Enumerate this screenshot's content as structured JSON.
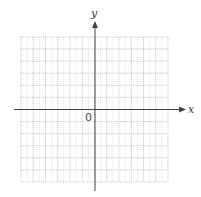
{
  "chart_data": {
    "type": "scatter",
    "title": "",
    "xlabel": "x",
    "ylabel": "y",
    "origin_label": "0",
    "grid": true,
    "grid_style": "dotted",
    "grid_columns": 12,
    "grid_rows": 12,
    "xlim": [
      -6,
      6
    ],
    "ylim": [
      -6,
      6
    ],
    "x": [],
    "values": []
  },
  "labels": {
    "x_axis": "x",
    "y_axis": "y",
    "origin": "0"
  },
  "colors": {
    "axis": "#444444",
    "grid": "#aaaaaa"
  }
}
